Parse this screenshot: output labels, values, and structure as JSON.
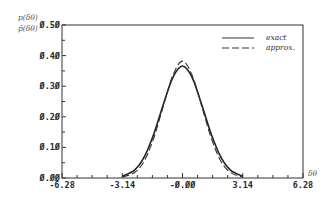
{
  "chart_data": {
    "type": "line",
    "title": "",
    "ylabel_lines": [
      "p(δθ)",
      "p̂(δθ)"
    ],
    "xlabel": "δθ",
    "xlim": [
      -6.28,
      6.28
    ],
    "ylim": [
      0.0,
      0.5
    ],
    "x_ticks": [
      "-6.28",
      "-3.14",
      "-0.00",
      "3.14",
      "6.28"
    ],
    "y_ticks": [
      "0.00",
      "0.10",
      "0.20",
      "0.30",
      "0.40",
      "0.50"
    ],
    "grid": false,
    "legend_position": "upper right",
    "series": [
      {
        "name": "exact",
        "style": "solid",
        "x": [
          -3.14,
          -2.5,
          -2.0,
          -1.5,
          -1.0,
          -0.5,
          0.0,
          0.5,
          1.0,
          1.5,
          2.0,
          2.5,
          3.14
        ],
        "y": [
          0.006,
          0.026,
          0.068,
          0.143,
          0.24,
          0.329,
          0.366,
          0.329,
          0.24,
          0.143,
          0.068,
          0.026,
          0.006
        ]
      },
      {
        "name": "approx.",
        "style": "dashed",
        "x": [
          -3.14,
          -2.5,
          -2.0,
          -1.5,
          -1.0,
          -0.5,
          0.0,
          0.5,
          1.0,
          1.5,
          2.0,
          2.5,
          3.14
        ],
        "y": [
          0.003,
          0.018,
          0.055,
          0.13,
          0.235,
          0.336,
          0.382,
          0.336,
          0.235,
          0.13,
          0.055,
          0.018,
          0.003
        ]
      }
    ]
  },
  "legend": {
    "exact_label": "exact",
    "approx_label": "approx."
  },
  "axes": {
    "y_label_top": "p(δθ)",
    "y_label_bottom": "p̂(δθ)",
    "x_label": "δθ"
  }
}
